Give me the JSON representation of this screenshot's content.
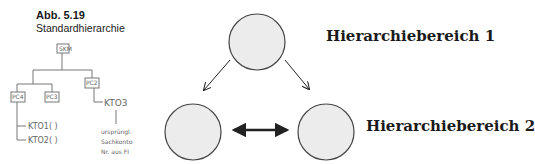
{
  "caption": {
    "figure_number": "Abb. 5.19",
    "title": "Standardhierarchie"
  },
  "sketch": {
    "root": "SKM",
    "nodes": [
      "PC4",
      "PC3",
      "PC2"
    ],
    "accounts": [
      "KTO1( )",
      "KTO2( )",
      "KTO3"
    ],
    "note_lines": [
      "ursprüngl.",
      "Sachkonto",
      "Nr. aus FI"
    ]
  },
  "diagram": {
    "labels": {
      "area1": "Hierarchiebereich 1",
      "area2": "Hierarchiebereich 2"
    },
    "colors": {
      "circle_fill": "#ececec",
      "circle_stroke": "#444444",
      "arrow": "#222222"
    }
  }
}
